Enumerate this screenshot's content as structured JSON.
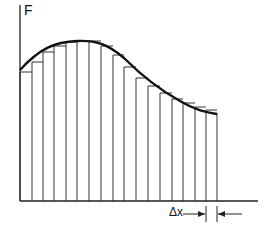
{
  "diagram": {
    "y_axis_label": "F",
    "delta_label": "Δx",
    "strip_count": 18,
    "colors": {
      "line": "#222222",
      "background": "#ffffff"
    }
  },
  "geometry": {
    "axis_x": 20,
    "baseline_y": 201,
    "axis_top_y": 5,
    "baseline_end_x": 258,
    "strip_edges_x": [
      20,
      32,
      43,
      54,
      66,
      77,
      89,
      101,
      113,
      124,
      136,
      148,
      160,
      172,
      183,
      195,
      206,
      217
    ],
    "strip_tops_y": [
      72,
      62,
      52,
      46,
      42,
      41,
      41,
      46,
      55,
      67,
      78,
      86,
      93,
      99,
      103,
      107,
      110,
      113
    ]
  }
}
